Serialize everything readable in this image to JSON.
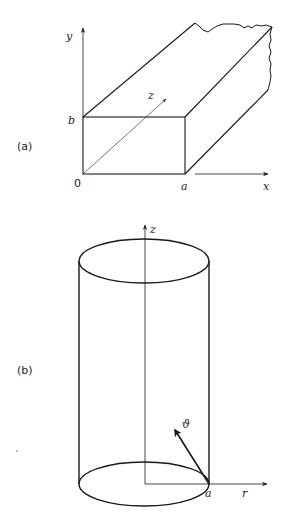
{
  "figure": {
    "panel_a": {
      "label": "(a)",
      "description": "Rectangular waveguide cross-section with width a and height b",
      "axes": {
        "x": "x",
        "y": "y",
        "z": "z"
      },
      "tick_labels": {
        "origin": "0",
        "width": "a",
        "height": "b"
      }
    },
    "panel_b": {
      "label": "(b)",
      "description": "Circular cylindrical waveguide of radius a",
      "axes": {
        "z": "z",
        "r": "r",
        "theta": "ϑ"
      },
      "tick_labels": {
        "radius": "a"
      }
    },
    "colors": {
      "stroke": "#1a1a1a",
      "background": "#ffffff"
    }
  }
}
